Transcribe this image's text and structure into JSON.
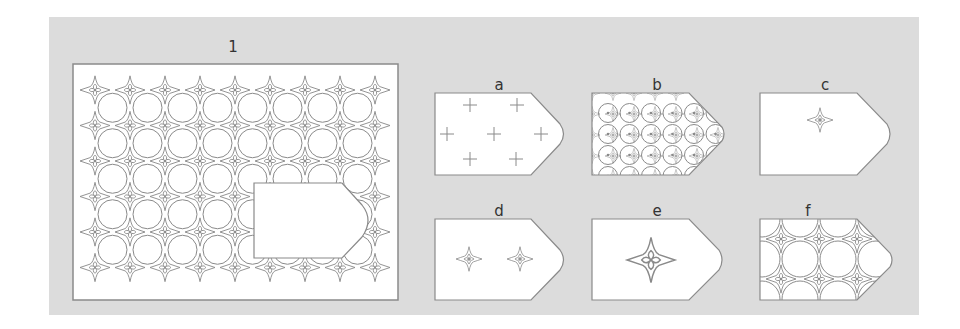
{
  "puzzle": {
    "main": {
      "label": "1"
    },
    "options": [
      {
        "id": "a",
        "label": "a",
        "fill": "crosses"
      },
      {
        "id": "b",
        "label": "b",
        "fill": "dense-circles"
      },
      {
        "id": "c",
        "label": "c",
        "fill": "single-small-star"
      },
      {
        "id": "d",
        "label": "d",
        "fill": "two-small-stars"
      },
      {
        "id": "e",
        "label": "e",
        "fill": "single-large-star"
      },
      {
        "id": "f",
        "label": "f",
        "fill": "star-grid"
      }
    ]
  },
  "colors": {
    "background": "#dcdcdc",
    "stroke": "#8a8a8a",
    "fill": "#ffffff"
  }
}
